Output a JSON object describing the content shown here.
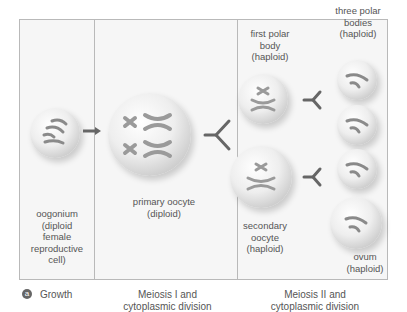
{
  "figure": {
    "panel_letter": "a",
    "stages": [
      {
        "name": "Growth"
      },
      {
        "name": "Meiosis I and\ncytoplasmic division"
      },
      {
        "name": "Meiosis II and\ncytoplasmic division"
      }
    ],
    "cells": {
      "oogonium": "oogonium\n(diploid\nfemale\nreproductive\ncell)",
      "primary_oocyte": "primary oocyte\n(diploid)",
      "first_polar_body": "first polar\nbody\n(haploid)",
      "secondary_oocyte": "secondary\noocyte\n(haploid)",
      "three_polar_bodies": "three polar\nbodies\n(haploid)",
      "ovum": "ovum\n(haploid)"
    },
    "colors": {
      "frame_border": "#b9b9b9",
      "background": "#f6f6f6",
      "chromosome": "#8a8a8a",
      "arrow": "#666666"
    }
  }
}
